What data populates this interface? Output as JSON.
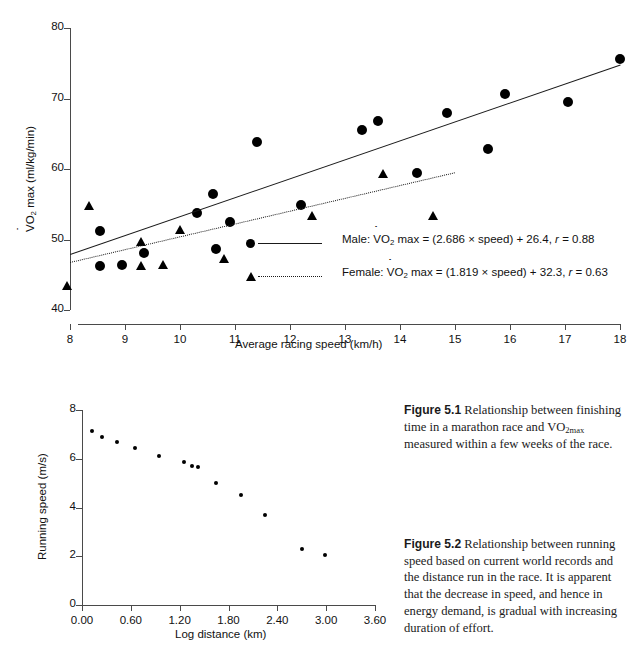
{
  "chart_data": [
    {
      "type": "scatter",
      "id": "fig-5-1",
      "title": "",
      "xlabel": "Average racing speed (km/h)",
      "ylabel": "V̇O2 max (ml/kg/min)",
      "xlim": [
        8,
        18
      ],
      "ylim": [
        40,
        80
      ],
      "xticks": [
        "8",
        "9",
        "10",
        "11",
        "12",
        "13",
        "14",
        "15",
        "16",
        "17",
        "18"
      ],
      "yticks": [
        "40",
        "50",
        "60",
        "70",
        "80"
      ],
      "grid": false,
      "legend_position": "inside-bottom-center",
      "series": [
        {
          "name": "Male",
          "marker": "circle",
          "fit": "solid",
          "equation_text": "Male: V̇O2 max = (2.686 × speed) + 26.4, r = 0.88",
          "slope": 2.686,
          "intercept": 26.4,
          "r": 0.88,
          "points": [
            [
              8.55,
              51.2
            ],
            [
              8.55,
              46.3
            ],
            [
              8.95,
              46.4
            ],
            [
              9.35,
              48.1
            ],
            [
              10.3,
              53.8
            ],
            [
              10.6,
              56.5
            ],
            [
              10.65,
              48.7
            ],
            [
              10.9,
              52.5
            ],
            [
              11.4,
              63.9
            ],
            [
              12.2,
              54.9
            ],
            [
              13.3,
              65.5
            ],
            [
              13.6,
              66.8
            ],
            [
              14.3,
              59.5
            ],
            [
              14.85,
              68.0
            ],
            [
              15.6,
              62.9
            ],
            [
              15.9,
              70.6
            ],
            [
              17.05,
              69.5
            ],
            [
              18.0,
              75.6
            ]
          ]
        },
        {
          "name": "Female",
          "marker": "triangle",
          "fit": "dotted",
          "equation_text": "Female: V̇O2 max = (1.819 × speed) + 32.3, r = 0.63",
          "slope": 1.819,
          "intercept": 32.3,
          "r": 0.63,
          "points": [
            [
              7.95,
              43.4
            ],
            [
              8.35,
              54.7
            ],
            [
              9.3,
              49.6
            ],
            [
              9.3,
              46.3
            ],
            [
              9.7,
              46.4
            ],
            [
              10.0,
              51.4
            ],
            [
              10.8,
              47.2
            ],
            [
              12.4,
              53.4
            ],
            [
              13.7,
              59.3
            ],
            [
              14.6,
              53.4
            ]
          ]
        }
      ]
    },
    {
      "type": "scatter",
      "id": "fig-5-2",
      "title": "",
      "xlabel": "Log distance (km)",
      "ylabel": "Running speed (m/s)",
      "xlim": [
        0.0,
        3.6
      ],
      "ylim": [
        0,
        8
      ],
      "xticks": [
        "0.00",
        "0.60",
        "1.20",
        "1.80",
        "2.40",
        "3.00",
        "3.60"
      ],
      "yticks": [
        "0",
        "2",
        "4",
        "6",
        "8"
      ],
      "grid": false,
      "legend_position": "none",
      "series": [
        {
          "name": "World record running speed",
          "marker": "small-dot",
          "points": [
            [
              0.12,
              7.15
            ],
            [
              0.25,
              6.9
            ],
            [
              0.43,
              6.68
            ],
            [
              0.65,
              6.45
            ],
            [
              0.95,
              6.12
            ],
            [
              1.25,
              5.87
            ],
            [
              1.35,
              5.7
            ],
            [
              1.42,
              5.65
            ],
            [
              1.65,
              4.99
            ],
            [
              1.95,
              4.52
            ],
            [
              2.25,
              3.68
            ],
            [
              2.7,
              2.3
            ],
            [
              2.98,
              2.05
            ]
          ]
        }
      ]
    }
  ],
  "figure_captions": [
    {
      "number": "Figure 5.1",
      "text_before": "Relationship between finishing time in a marathon race and VO",
      "subscript": "2max",
      "text_after": " measured within a few weeks of the race."
    },
    {
      "number": "Figure 5.2",
      "text_before": "Relationship between running speed based on current world records and the distance run in the race. It is apparent that the decrease in speed, and hence in energy demand, is gradual with increasing duration of effort.",
      "subscript": "",
      "text_after": ""
    }
  ],
  "colors": {
    "marker": "#000000",
    "axis": "#4a4a4a",
    "text": "#111111",
    "background": "#ffffff"
  }
}
